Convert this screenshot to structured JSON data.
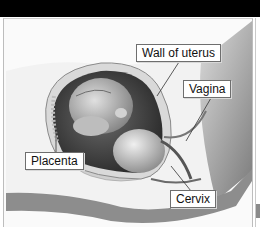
{
  "figure": {
    "labels": [
      {
        "id": "wall-of-uterus",
        "text": "Wall of uterus"
      },
      {
        "id": "vagina",
        "text": "Vagina"
      },
      {
        "id": "placenta",
        "text": "Placenta"
      },
      {
        "id": "cervix",
        "text": "Cervix"
      }
    ]
  },
  "colors": {
    "header_bar": "#000000",
    "background": "#fafafa",
    "label_border": "#6e6e6e"
  }
}
